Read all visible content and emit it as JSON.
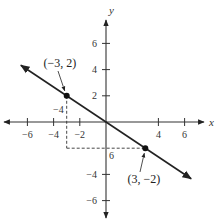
{
  "chart_data": {
    "type": "line",
    "title": "",
    "xlabel": "x",
    "ylabel": "y",
    "xlim": [
      -7.5,
      7.5
    ],
    "ylim": [
      -7.5,
      7.5
    ],
    "x_ticks": [
      -6,
      -4,
      -2,
      4,
      6
    ],
    "x_tick_labels": [
      "−6",
      "−4",
      "−2",
      "4",
      "6"
    ],
    "y_ticks": [
      6,
      4,
      2,
      -4,
      -6
    ],
    "y_tick_labels": [
      "6",
      "4",
      "2",
      "−4",
      "−6"
    ],
    "extra_labels": [
      {
        "text": "−4",
        "near": "x=-3 dashed line above x-axis"
      },
      {
        "text": "6",
        "near": "y=-2 dashed line right of y-axis"
      }
    ],
    "grid": false,
    "series": [
      {
        "name": "line",
        "x": [
          -6.5,
          6.5
        ],
        "y": [
          4.333,
          -4.333
        ],
        "slope": -0.6667,
        "arrows": "both"
      }
    ],
    "points": [
      {
        "x": -3,
        "y": 2,
        "label": "(−3, 2)"
      },
      {
        "x": 3,
        "y": -2,
        "label": "(3, −2)"
      }
    ],
    "dashed_guides": [
      {
        "from": [
          -3,
          2
        ],
        "to": [
          -3,
          -2
        ]
      },
      {
        "from": [
          -3,
          -2
        ],
        "to": [
          3,
          -2
        ]
      }
    ]
  }
}
